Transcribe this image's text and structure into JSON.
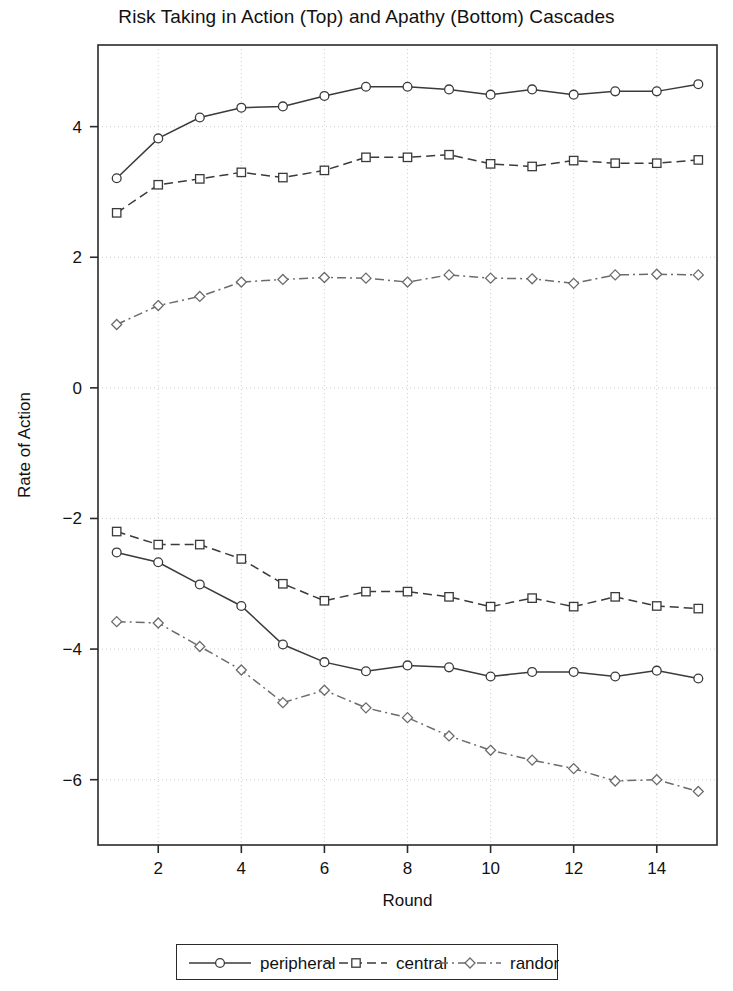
{
  "chart_data": {
    "type": "line",
    "title": "Risk Taking in Action (Top) and Apathy (Bottom) Cascades",
    "xlabel": "Round",
    "ylabel": "Rate of Action",
    "x": [
      1,
      2,
      3,
      4,
      5,
      6,
      7,
      8,
      9,
      10,
      11,
      12,
      13,
      14,
      15
    ],
    "xlim": [
      0.55,
      15.45
    ],
    "ylim": [
      -7.0,
      5.25
    ],
    "xticks": [
      2,
      4,
      6,
      8,
      10,
      12,
      14
    ],
    "yticks": [
      4,
      2,
      0,
      -2,
      -4,
      -6
    ],
    "grid": true,
    "legend_position": "below-axes",
    "series": [
      {
        "name": "peripheral",
        "group": "action-top",
        "marker": "circle",
        "dash": "solid",
        "color": "#3a3a3a",
        "values": [
          3.21,
          3.82,
          4.14,
          4.29,
          4.31,
          4.47,
          4.61,
          4.61,
          4.57,
          4.49,
          4.57,
          4.49,
          4.54,
          4.54,
          4.65
        ]
      },
      {
        "name": "central",
        "group": "action-top",
        "marker": "square",
        "dash": "dashed",
        "color": "#3a3a3a",
        "values": [
          2.68,
          3.11,
          3.2,
          3.3,
          3.22,
          3.33,
          3.53,
          3.53,
          3.57,
          3.43,
          3.39,
          3.48,
          3.44,
          3.44,
          3.49
        ]
      },
      {
        "name": "random",
        "group": "action-top",
        "marker": "diamond",
        "dash": "dashdot",
        "color": "#6b6b6b",
        "values": [
          0.97,
          1.26,
          1.4,
          1.62,
          1.66,
          1.69,
          1.68,
          1.62,
          1.73,
          1.68,
          1.67,
          1.6,
          1.73,
          1.74,
          1.73
        ]
      },
      {
        "name": "peripheral",
        "group": "apathy-bottom",
        "marker": "circle",
        "dash": "solid",
        "color": "#3a3a3a",
        "values": [
          -2.52,
          -2.67,
          -3.01,
          -3.34,
          -3.93,
          -4.2,
          -4.34,
          -4.25,
          -4.28,
          -4.42,
          -4.35,
          -4.35,
          -4.42,
          -4.33,
          -4.45
        ]
      },
      {
        "name": "central",
        "group": "apathy-bottom",
        "marker": "square",
        "dash": "dashed",
        "color": "#3a3a3a",
        "values": [
          -2.2,
          -2.4,
          -2.4,
          -2.62,
          -3.0,
          -3.26,
          -3.12,
          -3.12,
          -3.2,
          -3.35,
          -3.22,
          -3.35,
          -3.2,
          -3.34,
          -3.38
        ]
      },
      {
        "name": "random",
        "group": "apathy-bottom",
        "marker": "diamond",
        "dash": "dashdot",
        "color": "#6b6b6b",
        "values": [
          -3.58,
          -3.6,
          -3.96,
          -4.32,
          -4.82,
          -4.63,
          -4.9,
          -5.05,
          -5.33,
          -5.55,
          -5.7,
          -5.83,
          -6.02,
          -6.0,
          -6.18
        ]
      }
    ]
  },
  "legend": {
    "entries": [
      {
        "label": "peripheral",
        "marker": "circle",
        "dash": "solid"
      },
      {
        "label": "central",
        "marker": "square",
        "dash": "dashed"
      },
      {
        "label": "random",
        "marker": "diamond",
        "dash": "dashdot"
      }
    ]
  },
  "axes": {
    "x_tick_labels": [
      "2",
      "4",
      "6",
      "8",
      "10",
      "12",
      "14"
    ],
    "y_tick_labels": [
      "4",
      "2",
      "0",
      "−2",
      "−4",
      "−6"
    ]
  }
}
